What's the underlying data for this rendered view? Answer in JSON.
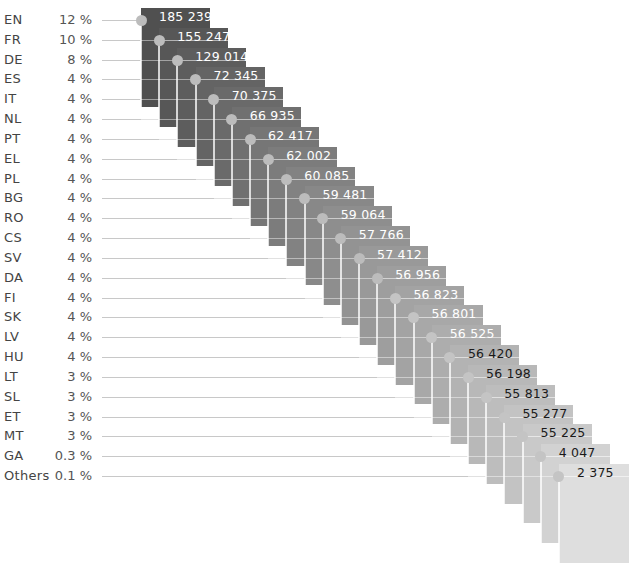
{
  "chart_data": {
    "type": "table",
    "title": "",
    "columns": [
      "language",
      "share",
      "count"
    ],
    "rows": [
      {
        "language": "EN",
        "share": "12 %",
        "count": "185 239",
        "color": "#505050",
        "text_color": "#ffffff"
      },
      {
        "language": "FR",
        "share": "10 %",
        "count": "155 247",
        "color": "#575757",
        "text_color": "#ffffff"
      },
      {
        "language": "DE",
        "share": "8 %",
        "count": "129 014",
        "color": "#5d5d5d",
        "text_color": "#ffffff"
      },
      {
        "language": "ES",
        "share": "4 %",
        "count": "72 345",
        "color": "#646464",
        "text_color": "#ffffff"
      },
      {
        "language": "IT",
        "share": "4 %",
        "count": "70 375",
        "color": "#6a6a6a",
        "text_color": "#ffffff"
      },
      {
        "language": "NL",
        "share": "4 %",
        "count": "66 935",
        "color": "#707070",
        "text_color": "#ffffff"
      },
      {
        "language": "PT",
        "share": "4 %",
        "count": "62 417",
        "color": "#767676",
        "text_color": "#ffffff"
      },
      {
        "language": "EL",
        "share": "4 %",
        "count": "62 002",
        "color": "#7c7c7c",
        "text_color": "#ffffff"
      },
      {
        "language": "PL",
        "share": "4 %",
        "count": "60 085",
        "color": "#828282",
        "text_color": "#ffffff"
      },
      {
        "language": "BG",
        "share": "4 %",
        "count": "59 481",
        "color": "#888888",
        "text_color": "#ffffff"
      },
      {
        "language": "RO",
        "share": "4 %",
        "count": "59 064",
        "color": "#8e8e8e",
        "text_color": "#ffffff"
      },
      {
        "language": "CS",
        "share": "4 %",
        "count": "57 766",
        "color": "#939393",
        "text_color": "#ffffff"
      },
      {
        "language": "SV",
        "share": "4 %",
        "count": "57 412",
        "color": "#999999",
        "text_color": "#ffffff"
      },
      {
        "language": "DA",
        "share": "4 %",
        "count": "56 956",
        "color": "#9e9e9e",
        "text_color": "#ffffff"
      },
      {
        "language": "FI",
        "share": "4 %",
        "count": "56 823",
        "color": "#a3a3a3",
        "text_color": "#ffffff"
      },
      {
        "language": "SK",
        "share": "4 %",
        "count": "56 801",
        "color": "#a8a8a8",
        "text_color": "#ffffff"
      },
      {
        "language": "LV",
        "share": "4 %",
        "count": "56 525",
        "color": "#adadad",
        "text_color": "#ffffff"
      },
      {
        "language": "HU",
        "share": "4 %",
        "count": "56 420",
        "color": "#b3b3b3",
        "text_color": "#1a1a1a"
      },
      {
        "language": "LT",
        "share": "3 %",
        "count": "56 198",
        "color": "#b8b8b8",
        "text_color": "#1a1a1a"
      },
      {
        "language": "SL",
        "share": "3 %",
        "count": "55 813",
        "color": "#bdbdbd",
        "text_color": "#1a1a1a"
      },
      {
        "language": "ET",
        "share": "3 %",
        "count": "55 277",
        "color": "#c3c3c3",
        "text_color": "#1a1a1a"
      },
      {
        "language": "MT",
        "share": "3 %",
        "count": "55 225",
        "color": "#c9c9c9",
        "text_color": "#1a1a1a"
      },
      {
        "language": "GA",
        "share": "0.3 %",
        "count": "4 047",
        "color": "#d2d2d2",
        "text_color": "#1a1a1a"
      },
      {
        "language": "Others",
        "share": "0.1 %",
        "count": "2 375",
        "color": "#dedede",
        "text_color": "#1a1a1a"
      }
    ],
    "categories": [
      "EN",
      "FR",
      "DE",
      "ES",
      "IT",
      "NL",
      "PT",
      "EL",
      "PL",
      "BG",
      "RO",
      "CS",
      "SV",
      "DA",
      "FI",
      "SK",
      "LV",
      "HU",
      "LT",
      "SL",
      "ET",
      "MT",
      "GA",
      "Others"
    ],
    "series": [
      {
        "name": "share_percent",
        "values": [
          12,
          10,
          8,
          4,
          4,
          4,
          4,
          4,
          4,
          4,
          4,
          4,
          4,
          4,
          4,
          4,
          4,
          4,
          3,
          3,
          3,
          3,
          0.3,
          0.1
        ]
      },
      {
        "name": "count",
        "values": [
          185239,
          155247,
          129014,
          72345,
          70375,
          66935,
          62417,
          62002,
          60085,
          59481,
          59064,
          57766,
          57412,
          56956,
          56823,
          56801,
          56525,
          56420,
          56198,
          55813,
          55277,
          55225,
          4047,
          2375
        ]
      }
    ],
    "grid": false,
    "legend": "none"
  }
}
